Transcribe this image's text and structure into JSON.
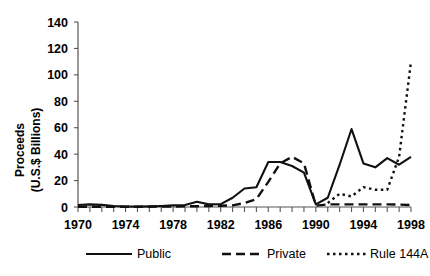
{
  "chart_data": {
    "type": "line",
    "title": "",
    "xlabel": "",
    "ylabel": "Proceeds (U.S.$ Billions)",
    "ylabel_line1": "Proceeds",
    "ylabel_line2": "(U.S.$ Billions)",
    "xlim": [
      1970,
      1998
    ],
    "ylim": [
      0,
      140
    ],
    "ytick_step": 20,
    "xtick_step": 1,
    "xtick_label_step": 4,
    "grid": false,
    "legend_position": "bottom",
    "yticks": [
      0,
      20,
      40,
      60,
      80,
      100,
      120,
      140
    ],
    "ytick_labels": [
      "0",
      "20",
      "40",
      "60",
      "80",
      "100",
      "120",
      "140"
    ],
    "xticks": [
      1970,
      1971,
      1972,
      1973,
      1974,
      1975,
      1976,
      1977,
      1978,
      1979,
      1980,
      1981,
      1982,
      1983,
      1984,
      1985,
      1986,
      1987,
      1988,
      1989,
      1990,
      1991,
      1992,
      1993,
      1994,
      1995,
      1996,
      1997,
      1998
    ],
    "xtick_labels": [
      "1970",
      "1974",
      "1978",
      "1982",
      "1986",
      "1990",
      "1994",
      "1998"
    ],
    "xtick_label_years": [
      1970,
      1974,
      1978,
      1982,
      1986,
      1990,
      1994,
      1998
    ],
    "x": [
      1970,
      1971,
      1972,
      1973,
      1974,
      1975,
      1976,
      1977,
      1978,
      1979,
      1980,
      1981,
      1982,
      1983,
      1984,
      1985,
      1986,
      1987,
      1988,
      1989,
      1990,
      1991,
      1992,
      1993,
      1994,
      1995,
      1996,
      1997,
      1998
    ],
    "series": [
      {
        "name": "Public",
        "style": "solid",
        "color": "#111111",
        "values": [
          1.5,
          2.0,
          1.6,
          0.8,
          0.4,
          0.3,
          0.5,
          0.8,
          1.2,
          1.5,
          4.0,
          2.0,
          2.2,
          7.0,
          14.0,
          15.0,
          34.0,
          34.0,
          31.0,
          26.0,
          2.0,
          7.0,
          32.0,
          59.0,
          33.0,
          30.0,
          37.0,
          32.0,
          38.0
        ]
      },
      {
        "name": "Private",
        "style": "dashed",
        "color": "#111111",
        "values": [
          0.2,
          0.2,
          0.2,
          0.2,
          0.2,
          0.2,
          0.2,
          0.3,
          0.4,
          0.5,
          0.6,
          0.8,
          1.0,
          1.2,
          3.0,
          6.0,
          19.0,
          33.0,
          38.0,
          33.0,
          1.0,
          2.0,
          2.0,
          2.0,
          2.0,
          2.0,
          2.0,
          1.8,
          1.5
        ]
      },
      {
        "name": "Rule 144A",
        "style": "dotted",
        "color": "#111111",
        "values": [
          null,
          null,
          null,
          null,
          null,
          null,
          null,
          null,
          null,
          null,
          null,
          null,
          null,
          null,
          null,
          null,
          null,
          null,
          null,
          null,
          null,
          3.0,
          10.0,
          8.0,
          15.0,
          13.0,
          13.0,
          38.0,
          110.0
        ]
      }
    ],
    "legend": [
      {
        "label": "Public",
        "style": "solid"
      },
      {
        "label": "Private",
        "style": "dashed"
      },
      {
        "label": "Rule 144A",
        "style": "dotted"
      }
    ]
  }
}
